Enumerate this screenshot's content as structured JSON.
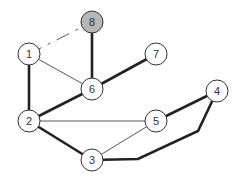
{
  "diagram": {
    "type": "graph",
    "node_radius": 11,
    "colors": {
      "node_fill": "#ffffff",
      "highlight_fill": "#b7b7b7",
      "stroke": "#333333",
      "thick_edge": "#222222",
      "thin_edge": "#444444"
    },
    "nodes": [
      {
        "id": "1",
        "label": "1",
        "x": 29,
        "y": 54,
        "highlight": false
      },
      {
        "id": "2",
        "label": "2",
        "x": 29,
        "y": 121,
        "highlight": false
      },
      {
        "id": "3",
        "label": "3",
        "x": 92,
        "y": 160,
        "highlight": false
      },
      {
        "id": "4",
        "label": "4",
        "x": 217,
        "y": 91,
        "highlight": false
      },
      {
        "id": "5",
        "label": "5",
        "x": 156,
        "y": 121,
        "highlight": false
      },
      {
        "id": "6",
        "label": "6",
        "x": 92,
        "y": 89,
        "highlight": false
      },
      {
        "id": "7",
        "label": "7",
        "x": 156,
        "y": 54,
        "highlight": false
      },
      {
        "id": "8",
        "label": "8",
        "x": 92,
        "y": 22,
        "highlight": true
      }
    ],
    "edges": [
      {
        "from": "1",
        "to": "8",
        "style": "dashed",
        "weight": "thin"
      },
      {
        "from": "1",
        "to": "6",
        "style": "solid",
        "weight": "thin"
      },
      {
        "from": "1",
        "to": "2",
        "style": "solid",
        "weight": "thick"
      },
      {
        "from": "8",
        "to": "6",
        "style": "solid",
        "weight": "thick"
      },
      {
        "from": "6",
        "to": "7",
        "style": "solid",
        "weight": "thick"
      },
      {
        "from": "6",
        "to": "2",
        "style": "solid",
        "weight": "thick"
      },
      {
        "from": "2",
        "to": "5",
        "style": "solid",
        "weight": "thin"
      },
      {
        "from": "2",
        "to": "3",
        "style": "solid",
        "weight": "thick"
      },
      {
        "from": "3",
        "to": "5",
        "style": "solid",
        "weight": "thin"
      },
      {
        "from": "5",
        "to": "4",
        "style": "solid",
        "weight": "thick"
      },
      {
        "from": "3",
        "to": "4",
        "style": "solid",
        "weight": "thick",
        "via": [
          [
            138,
            159
          ],
          [
            198,
            131
          ]
        ]
      }
    ]
  }
}
